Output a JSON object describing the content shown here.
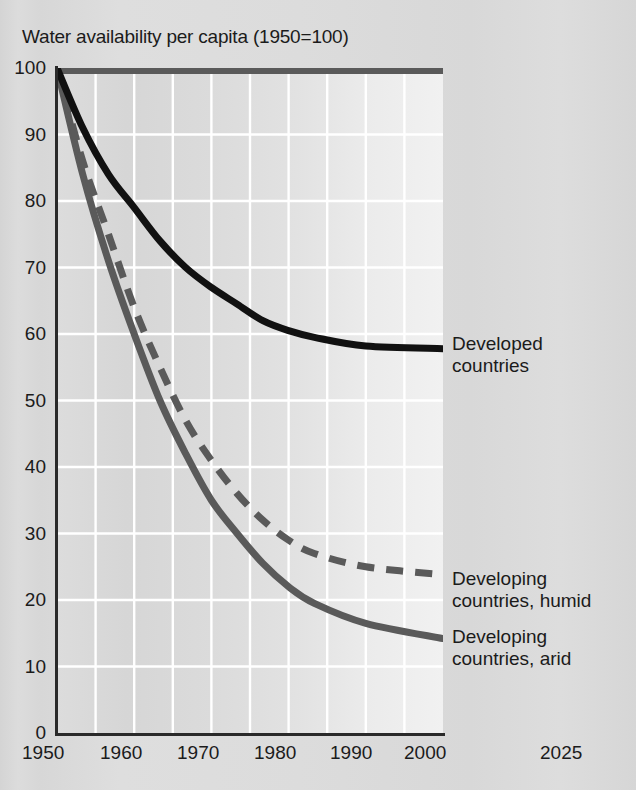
{
  "chart": {
    "title": "Water availability per capita (1950=100)",
    "y_ticks": [
      "100",
      "90",
      "80",
      "70",
      "60",
      "50",
      "40",
      "30",
      "20",
      "10",
      "0"
    ],
    "x_ticks": [
      "1950",
      "1960",
      "1970",
      "1980",
      "1990",
      "2000",
      "2025"
    ],
    "legend": {
      "developed_line1": "Developed",
      "developed_line2": "countries",
      "humid_line1": "Developing",
      "humid_line2": "countries, humid",
      "arid_line1": "Developing",
      "arid_line2": "countries, arid"
    },
    "colors": {
      "developed": "#111111",
      "developing_humid": "#5a5a5a",
      "developing_arid": "#5a5a5a",
      "axis": "#2a2a2a",
      "grid": "#ffffff",
      "plot_background": "#dcdcdc",
      "page_background": "#d9d9d9",
      "text": "#1b1b1b"
    }
  },
  "chart_data": {
    "type": "line",
    "title": "Water availability per capita (1950=100)",
    "xlabel": "",
    "ylabel": "Water availability per capita (1950=100)",
    "xlim": [
      1950,
      2025
    ],
    "ylim": [
      0,
      100
    ],
    "ytick_values": [
      0,
      10,
      20,
      30,
      40,
      50,
      60,
      70,
      80,
      90,
      100
    ],
    "xtick_values": [
      1950,
      1960,
      1970,
      1980,
      1990,
      2000,
      2025
    ],
    "grid": true,
    "legend_position": "right-of-plot (direct line labels)",
    "x": [
      1950,
      1955,
      1960,
      1965,
      1970,
      1975,
      1980,
      1985,
      1990,
      1995,
      2000,
      2010,
      2025
    ],
    "series": [
      {
        "name": "Developed countries",
        "style": "solid",
        "color": "#111111",
        "values": [
          100,
          91,
          84,
          79,
          74,
          70,
          67,
          64.5,
          62,
          60.5,
          59.5,
          58.2,
          57.8
        ]
      },
      {
        "name": "Developing countries, humid",
        "style": "dashed",
        "color": "#5a5a5a",
        "values": [
          100,
          86,
          75,
          64,
          55,
          47,
          41,
          36,
          32,
          29,
          27,
          25,
          23.8
        ]
      },
      {
        "name": "Developing countries, arid",
        "style": "solid",
        "color": "#5a5a5a",
        "values": [
          100,
          84,
          71,
          60,
          50,
          42,
          35,
          30,
          25.5,
          22,
          19.5,
          16.5,
          14.2
        ]
      }
    ],
    "reference_line": {
      "description": "horizontal rule at value 100 across the top of the plot",
      "value": 100,
      "color": "#5a5a5a"
    }
  }
}
